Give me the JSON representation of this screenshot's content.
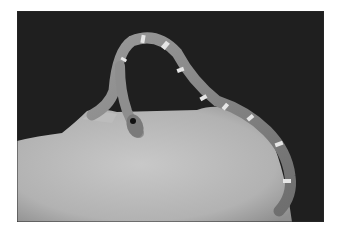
{
  "image": {
    "subject": "Banded snake biting a hand, black and white photograph",
    "colors": {
      "background": "#1e1e1e",
      "skin": "#bdbdbd",
      "snake": "#8a8a8a",
      "bands": "#e8e8e8",
      "page": "#ffffff"
    }
  }
}
